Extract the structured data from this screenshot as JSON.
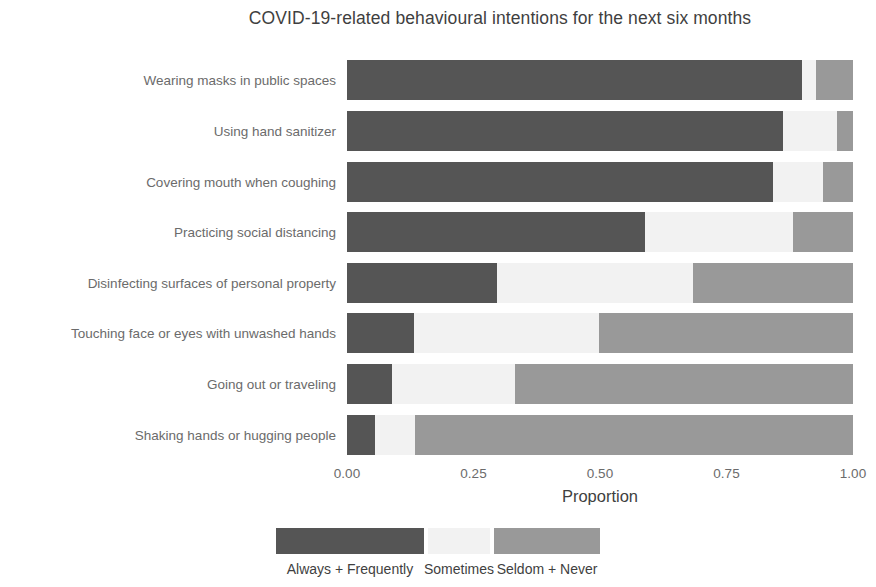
{
  "chart_data": {
    "type": "bar",
    "orientation": "horizontal",
    "stacked": true,
    "normalized": true,
    "title": "COVID-19-related behavioural intentions for the next six months",
    "xlabel": "Proportion",
    "ylabel": "",
    "xlim": [
      0,
      1
    ],
    "xticks": [
      0.0,
      0.25,
      0.5,
      0.75,
      1.0
    ],
    "xtick_labels": [
      "0.00",
      "0.25",
      "0.50",
      "0.75",
      "1.00"
    ],
    "grid": false,
    "legend_position": "bottom",
    "categories": [
      "Wearing masks in public spaces",
      "Using hand sanitizer",
      "Covering mouth when coughing",
      "Practicing social distancing",
      "Disinfecting surfaces of personal property",
      "Touching face or eyes with unwashed hands",
      "Going out or traveling",
      "Shaking hands or hugging people"
    ],
    "series": [
      {
        "name": "Always + Frequently",
        "color": "#555555",
        "values": [
          0.9,
          0.861,
          0.842,
          0.589,
          0.296,
          0.132,
          0.089,
          0.055
        ]
      },
      {
        "name": "Sometimes",
        "color": "#f2f2f2",
        "values": [
          0.026,
          0.107,
          0.099,
          0.292,
          0.387,
          0.366,
          0.243,
          0.079
        ]
      },
      {
        "name": "Seldom + Never",
        "color": "#999999",
        "values": [
          0.074,
          0.032,
          0.059,
          0.119,
          0.317,
          0.502,
          0.668,
          0.866
        ]
      }
    ]
  },
  "colors": {
    "always_frequently": "#555555",
    "sometimes": "#f2f2f2",
    "seldom_never": "#999999",
    "background": "#ffffff",
    "text": "#4d4d4d"
  }
}
